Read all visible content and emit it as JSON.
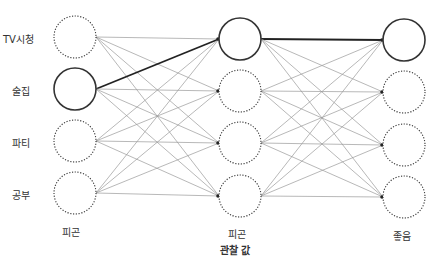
{
  "diagram": {
    "type": "hmm-trellis",
    "row_labels": [
      "TV시청",
      "술집",
      "파티",
      "공부"
    ],
    "column_labels": [
      "피곤",
      "피곤",
      "좋음"
    ],
    "caption": "관찰 값",
    "columns": [
      {
        "x": 75,
        "ys": [
          37,
          89,
          141,
          193
        ],
        "active": 1
      },
      {
        "x": 240,
        "ys": [
          39,
          91,
          143,
          196
        ],
        "active": 0
      },
      {
        "x": 404,
        "ys": [
          40,
          92,
          145,
          197
        ],
        "active": 0
      }
    ],
    "node_radius": 21,
    "colors": {
      "edge": "#9a9a9a",
      "path": "#222222",
      "node": "#333333"
    }
  }
}
